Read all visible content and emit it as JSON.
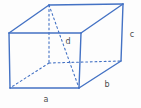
{
  "colors": {
    "line": "#4472C4",
    "hidden_line": "#4472C4",
    "label": "#4d4d4d",
    "background": "#fdfdfd"
  },
  "diagram": {
    "type": "cuboid-wireframe",
    "canvas": {
      "width": 141,
      "height": 108
    },
    "vertices": {
      "top_back_left": [
        49,
        5
      ],
      "top_back_right": [
        123,
        4
      ],
      "top_front_left": [
        9,
        33
      ],
      "top_front_right": [
        81,
        33
      ],
      "bottom_front_left": [
        10,
        88
      ],
      "bottom_front_right": [
        79,
        88
      ],
      "bottom_back_right": [
        121,
        61
      ],
      "bottom_back_left": [
        49,
        63
      ]
    },
    "edges": [
      {
        "name": "top-front-edge",
        "from": "top_front_left",
        "to": "top_front_right",
        "style": "solid"
      },
      {
        "name": "top-back-edge",
        "from": "top_back_left",
        "to": "top_back_right",
        "style": "solid"
      },
      {
        "name": "top-left-edge",
        "from": "top_front_left",
        "to": "top_back_left",
        "style": "solid"
      },
      {
        "name": "top-right-edge",
        "from": "top_front_right",
        "to": "top_back_right",
        "style": "solid"
      },
      {
        "name": "front-left-vertical-edge",
        "from": "top_front_left",
        "to": "bottom_front_left",
        "style": "solid"
      },
      {
        "name": "front-right-vertical-edge",
        "from": "top_front_right",
        "to": "bottom_front_right",
        "style": "solid"
      },
      {
        "name": "bottom-front-edge-a",
        "from": "bottom_front_left",
        "to": "bottom_front_right",
        "style": "solid"
      },
      {
        "name": "back-right-vertical-edge-c",
        "from": "top_back_right",
        "to": "bottom_back_right",
        "style": "solid"
      },
      {
        "name": "bottom-right-edge-b",
        "from": "bottom_front_right",
        "to": "bottom_back_right",
        "style": "solid"
      },
      {
        "name": "back-left-vertical-edge-hidden",
        "from": "top_back_left",
        "to": "bottom_back_left",
        "style": "dashed"
      },
      {
        "name": "bottom-left-edge-hidden",
        "from": "bottom_back_left",
        "to": "bottom_front_left",
        "style": "dashed"
      },
      {
        "name": "bottom-back-edge-hidden",
        "from": "bottom_back_left",
        "to": "bottom_back_right",
        "style": "dashed"
      },
      {
        "name": "space-diagonal-d",
        "from": "top_back_left",
        "to": "bottom_front_right",
        "style": "dashed"
      }
    ],
    "labels": [
      {
        "text": "a",
        "x": 46,
        "y": 100
      },
      {
        "text": "b",
        "x": 107,
        "y": 85
      },
      {
        "text": "c",
        "x": 132,
        "y": 35
      },
      {
        "text": "d",
        "x": 68,
        "y": 42
      }
    ]
  }
}
